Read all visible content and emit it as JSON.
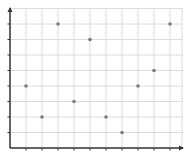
{
  "chart_data": {
    "type": "scatter",
    "title": "",
    "xlabel": "",
    "ylabel": "",
    "x": [
      1,
      2,
      3,
      4,
      5,
      6,
      7,
      8,
      9,
      10
    ],
    "y": [
      4,
      2,
      8,
      3,
      7,
      2,
      1,
      4,
      5,
      8
    ],
    "series": [
      {
        "name": "points",
        "points": [
          [
            1,
            4
          ],
          [
            2,
            2
          ],
          [
            3,
            8
          ],
          [
            4,
            3
          ],
          [
            5,
            7
          ],
          [
            6,
            2
          ],
          [
            7,
            1
          ],
          [
            8,
            4
          ],
          [
            9,
            5
          ],
          [
            10,
            8
          ]
        ]
      }
    ],
    "xlim": [
      0,
      10.8
    ],
    "ylim": [
      0,
      9
    ],
    "xticks": [
      1,
      2,
      3,
      4,
      5,
      6,
      7,
      8,
      9,
      10
    ],
    "yticks": [
      1,
      2,
      3,
      4,
      5,
      6,
      7,
      8
    ],
    "tick_labels_shown": false,
    "grid": true,
    "legend": "none",
    "colors": {
      "point": "#7a7a7a",
      "grid": "#dcdcdc",
      "axis": "#333333"
    }
  }
}
